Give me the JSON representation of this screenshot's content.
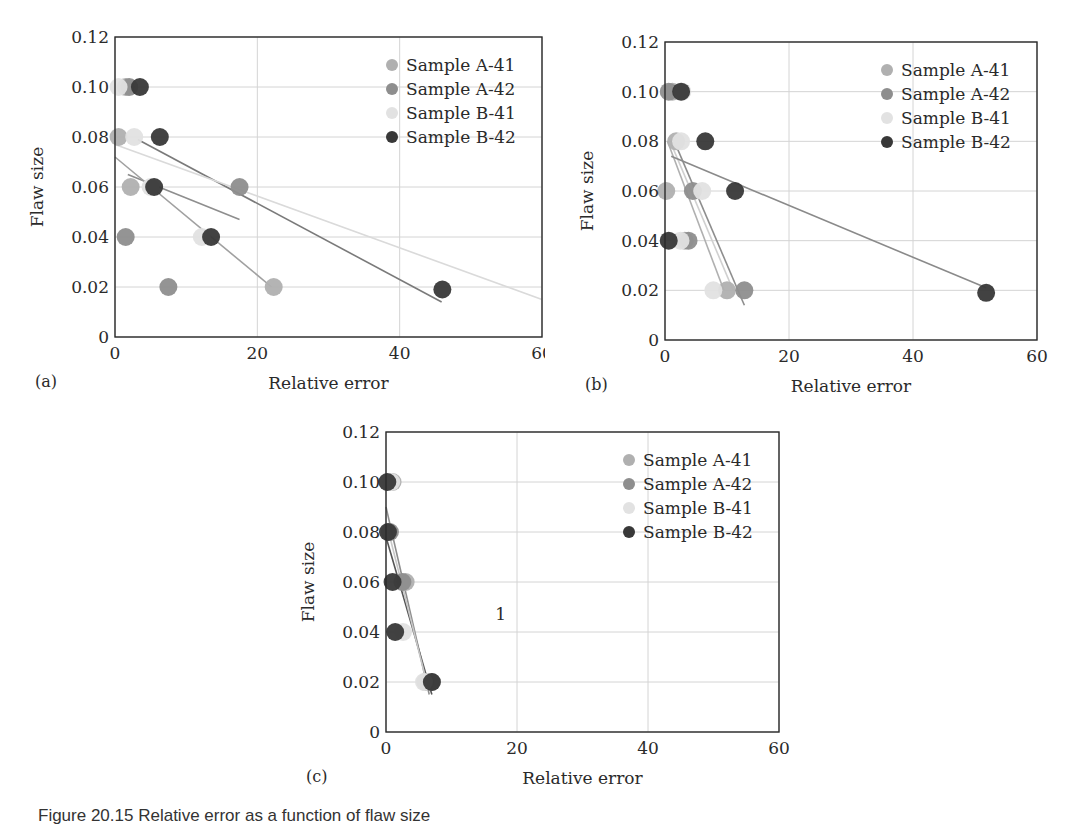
{
  "figure": {
    "caption": "Figure 20.15 Relative error as a function of flaw size"
  },
  "colors": {
    "Sample A-41": "#b0b0b0",
    "Sample A-42": "#8e8e8e",
    "Sample B-41": "#e2e2e2",
    "Sample B-42": "#383838",
    "axis": "#2a2a2a",
    "grid": "#d4d4d4"
  },
  "chart_data": [
    {
      "panel_label": "(a)",
      "type": "scatter",
      "title": "",
      "xlabel": "Relative error",
      "ylabel": "Flaw size",
      "xlim": [
        0,
        60
      ],
      "ylim": [
        0,
        0.12
      ],
      "xticks": [
        "0",
        "20",
        "40",
        "60"
      ],
      "yticks": [
        "0",
        "0.02",
        "0.04",
        "0.06",
        "0.08",
        "0.10",
        "0.12"
      ],
      "grid": true,
      "legend_position": "upper right",
      "legend": [
        "Sample A-41",
        "Sample A-42",
        "Sample B-41",
        "Sample B-42"
      ],
      "series": [
        {
          "name": "Sample A-41",
          "points": [
            [
              1.5,
              0.1
            ],
            [
              0.5,
              0.08
            ],
            [
              2.2,
              0.06
            ],
            [
              22.3,
              0.02
            ]
          ]
        },
        {
          "name": "Sample A-42",
          "points": [
            [
              2.0,
              0.1
            ],
            [
              17.5,
              0.06
            ],
            [
              1.5,
              0.04
            ],
            [
              7.5,
              0.02
            ]
          ]
        },
        {
          "name": "Sample B-41",
          "points": [
            [
              0.5,
              0.1
            ],
            [
              2.7,
              0.08
            ],
            [
              5.0,
              0.06
            ],
            [
              12.2,
              0.04
            ]
          ]
        },
        {
          "name": "Sample B-42",
          "points": [
            [
              3.5,
              0.1
            ],
            [
              6.3,
              0.08
            ],
            [
              5.5,
              0.06
            ],
            [
              13.5,
              0.04
            ],
            [
              46.0,
              0.019
            ]
          ]
        }
      ],
      "trendlines": [
        {
          "color": "#8e8e8e",
          "from": [
            1.8,
            0.065
          ],
          "to": [
            17.5,
            0.047
          ]
        },
        {
          "color": "#a0a0a0",
          "from": [
            0.0,
            0.072
          ],
          "to": [
            22.0,
            0.02
          ]
        },
        {
          "color": "#7a7a7a",
          "from": [
            3.2,
            0.079
          ],
          "to": [
            45.9,
            0.014
          ]
        },
        {
          "color": "#dadada",
          "from": [
            0.0,
            0.077
          ],
          "to": [
            60.0,
            0.015
          ]
        }
      ],
      "annotations": []
    },
    {
      "panel_label": "(b)",
      "type": "scatter",
      "title": "",
      "xlabel": "Relative error",
      "ylabel": "Flaw size",
      "xlim": [
        0,
        60
      ],
      "ylim": [
        0,
        0.12
      ],
      "xticks": [
        "0",
        "20",
        "40",
        "60"
      ],
      "yticks": [
        "0",
        "0.02",
        "0.04",
        "0.06",
        "0.08",
        "0.10",
        "0.12"
      ],
      "grid": true,
      "legend_position": "upper right",
      "legend": [
        "Sample A-41",
        "Sample A-42",
        "Sample B-41",
        "Sample B-42"
      ],
      "series": [
        {
          "name": "Sample A-41",
          "points": [
            [
              1.2,
              0.1
            ],
            [
              1.8,
              0.08
            ],
            [
              0.2,
              0.06
            ],
            [
              3.2,
              0.04
            ],
            [
              10.0,
              0.02
            ]
          ]
        },
        {
          "name": "Sample A-42",
          "points": [
            [
              0.6,
              0.1
            ],
            [
              4.5,
              0.06
            ],
            [
              3.8,
              0.04
            ],
            [
              12.8,
              0.02
            ]
          ]
        },
        {
          "name": "Sample B-41",
          "points": [
            [
              2.8,
              0.1
            ],
            [
              2.6,
              0.08
            ],
            [
              6.0,
              0.06
            ],
            [
              2.5,
              0.04
            ],
            [
              7.8,
              0.02
            ]
          ]
        },
        {
          "name": "Sample B-42",
          "points": [
            [
              2.6,
              0.1
            ],
            [
              6.5,
              0.08
            ],
            [
              11.3,
              0.06
            ],
            [
              0.6,
              0.04
            ],
            [
              51.8,
              0.019
            ]
          ]
        }
      ],
      "trendlines": [
        {
          "color": "#b0b0b0",
          "from": [
            0.4,
            0.08
          ],
          "to": [
            9.5,
            0.02
          ]
        },
        {
          "color": "#8e8e8e",
          "from": [
            1.5,
            0.08
          ],
          "to": [
            12.8,
            0.014
          ]
        },
        {
          "color": "#d0d0d0",
          "from": [
            1.0,
            0.079
          ],
          "to": [
            11.0,
            0.02
          ]
        },
        {
          "color": "#8a8a8a",
          "from": [
            1.0,
            0.074
          ],
          "to": [
            51.8,
            0.021
          ]
        }
      ],
      "annotations": []
    },
    {
      "panel_label": "(c)",
      "type": "scatter",
      "title": "",
      "xlabel": "Relative error",
      "ylabel": "Flaw size",
      "xlim": [
        0,
        60
      ],
      "ylim": [
        0,
        0.12
      ],
      "xticks": [
        "0",
        "20",
        "40",
        "60"
      ],
      "yticks": [
        "0",
        "0.02",
        "0.04",
        "0.06",
        "0.08",
        "0.10",
        "0.12"
      ],
      "grid": true,
      "legend_position": "upper right",
      "legend": [
        "Sample A-41",
        "Sample A-42",
        "Sample B-41",
        "Sample B-42"
      ],
      "series": [
        {
          "name": "Sample A-41",
          "points": [
            [
              1.0,
              0.1
            ],
            [
              3.0,
              0.06
            ],
            [
              6.0,
              0.02
            ]
          ]
        },
        {
          "name": "Sample A-42",
          "points": [
            [
              0.6,
              0.08
            ],
            [
              2.5,
              0.06
            ],
            [
              7.0,
              0.02
            ]
          ]
        },
        {
          "name": "Sample B-41",
          "points": [
            [
              0.8,
              0.1
            ],
            [
              2.6,
              0.04
            ],
            [
              5.8,
              0.02
            ]
          ]
        },
        {
          "name": "Sample B-42",
          "points": [
            [
              0.2,
              0.1
            ],
            [
              0.3,
              0.08
            ],
            [
              1.0,
              0.06
            ],
            [
              1.4,
              0.04
            ],
            [
              7.0,
              0.02
            ]
          ]
        }
      ],
      "trendlines": [
        {
          "color": "#8e8e8e",
          "from": [
            0.0,
            0.09
          ],
          "to": [
            6.6,
            0.015
          ]
        },
        {
          "color": "#555555",
          "from": [
            0.0,
            0.078
          ],
          "to": [
            7.0,
            0.015
          ]
        },
        {
          "color": "#c8c8c8",
          "from": [
            0.4,
            0.08
          ],
          "to": [
            6.4,
            0.018
          ]
        }
      ],
      "annotations": [
        {
          "text": "1",
          "x": 17.5,
          "y": 0.045
        }
      ]
    }
  ]
}
